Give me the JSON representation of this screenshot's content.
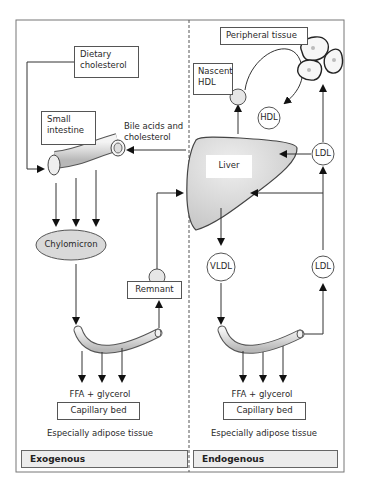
{
  "diagram": {
    "panels": {
      "left": {
        "label": "Exogenous"
      },
      "right": {
        "label": "Endogenous"
      }
    },
    "nodes": {
      "dietary_cholesterol": "Dietary\ncholesterol",
      "dietary_line1": "Dietary",
      "dietary_line2": "cholesterol",
      "small_intestine_line1": "Small",
      "small_intestine_line2": "intestine",
      "bile_line1": "Bile acids and",
      "bile_line2": "cholesterol",
      "chylomicron": "Chylomicron",
      "remnant": "Remnant",
      "liver": "Liver",
      "peripheral_tissue": "Peripheral tissue",
      "nascent_line1": "Nascent",
      "nascent_line2": "HDL",
      "hdl": "HDL",
      "ldl_upper": "LDL",
      "ldl_lower": "LDL",
      "vldl": "VLDL",
      "ffa_left": "FFA + glycerol",
      "ffa_right": "FFA + glycerol",
      "capillary_left": "Capillary bed",
      "capillary_right": "Capillary bed",
      "adipose_left": "Especially adipose tissue",
      "adipose_right": "Especially adipose tissue"
    },
    "colors": {
      "line": "#333333",
      "shape_fill": "#d9d9d9",
      "footer_fill": "#ececec",
      "frame": "#666666"
    }
  }
}
